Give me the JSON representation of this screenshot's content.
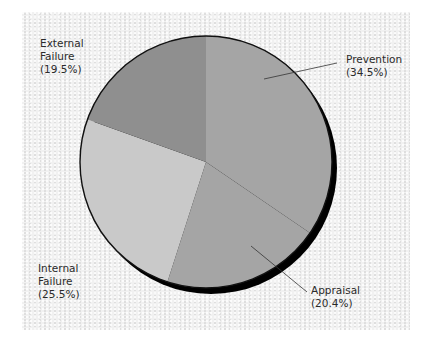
{
  "chart_data": {
    "type": "pie",
    "title": "",
    "categories": [
      "Prevention",
      "Appraisal",
      "Internal Failure",
      "External Failure"
    ],
    "values": [
      34.5,
      20.4,
      25.5,
      19.5
    ],
    "value_labels": [
      "(34.5%)",
      "(20.4%)",
      "(25.5%)",
      "(19.5%)"
    ],
    "start_angle_deg": -90,
    "direction": "clockwise",
    "colors": [
      "#a5a5a5",
      "#a5a5a5",
      "#c9c9c9",
      "#8f8f8f"
    ],
    "legend": "none (direct labels)"
  },
  "labels": {
    "prevention": {
      "line1": "Prevention",
      "line2": "(34.5%)"
    },
    "appraisal": {
      "line1": "Appraisal",
      "line2": "(20.4%)"
    },
    "internal": {
      "line1": "Internal",
      "line2": "Failure",
      "line3": "(25.5%)"
    },
    "external": {
      "line1": "External",
      "line2": "Failure",
      "line3": "(19.5%)"
    }
  },
  "style": {
    "background": "#f1f1f1",
    "outline": "#111111",
    "shadow": "#000000"
  }
}
